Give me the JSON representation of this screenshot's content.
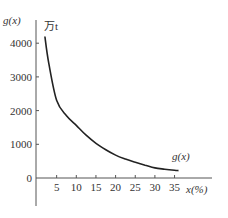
{
  "chart_data": {
    "type": "line",
    "title": "",
    "xlabel": "x (%)",
    "ylabel": "g(x)",
    "y_unit": "万t",
    "curve_label": "g(x)",
    "xlim": [
      0,
      40
    ],
    "ylim": [
      -800,
      4600
    ],
    "x_ticks": [
      5,
      10,
      15,
      20,
      25,
      30,
      35
    ],
    "x_tick_labels": [
      "5",
      "10",
      "15",
      "20",
      "25",
      "30",
      "35"
    ],
    "y_ticks": [
      0,
      1000,
      2000,
      3000,
      4000
    ],
    "y_tick_labels": [
      "0",
      "1000",
      "2000",
      "3000",
      "4000"
    ],
    "grid": false,
    "legend": "none",
    "series": [
      {
        "name": "g(x)",
        "x": [
          2,
          3,
          5,
          7.5,
          10,
          12.5,
          15,
          17.5,
          20,
          22.5,
          25,
          27.5,
          30,
          32.5,
          35,
          36
        ],
        "values": [
          4200,
          3400,
          2300,
          1850,
          1560,
          1270,
          1030,
          840,
          680,
          560,
          470,
          380,
          300,
          260,
          230,
          220
        ]
      }
    ]
  },
  "labels": {
    "y_axis": "g(x)",
    "unit": "万t",
    "x_axis": "x(%)",
    "curve": "g(x)"
  }
}
